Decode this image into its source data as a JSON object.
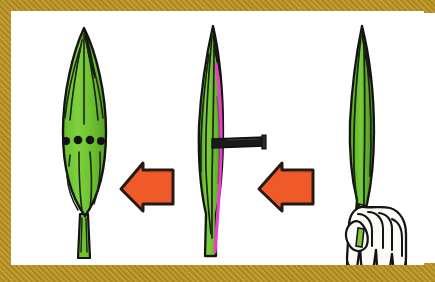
{
  "figure": {
    "title": "Folded leaf pierced with a pin, then unfolded to reveal a row of holes",
    "background_color": "#ffffff",
    "frame": {
      "color": "#b8911f",
      "style": "gold textured border",
      "thickness_px": {
        "top": 11,
        "bottom": 17,
        "left": 11,
        "right": 11
      }
    },
    "reading_direction": "right to left"
  },
  "palette": {
    "leaf_green_light": "#72c832",
    "leaf_green_mid": "#5aa82a",
    "leaf_green_dark": "#3f7d1e",
    "leaf_tip_dark": "#1d2a14",
    "outline": "#141414",
    "fold_magenta": "#e83fc8",
    "pin_black": "#1a1a1a",
    "arrow_orange": "#f05a28",
    "arrow_outline": "#241a14",
    "skin": "#fdfbf7",
    "frame_gold": "#b8911f",
    "paper_white": "#ffffff"
  },
  "panels": [
    {
      "id": "panel-open",
      "order": 3,
      "name": "unfolded-leaf-with-holes",
      "label": "Unfolded leaf showing four pin holes",
      "leaf_state": "flat / unfolded",
      "hole_count": 4,
      "hole_color": "#141414",
      "notes": "Four black dots in a horizontal row across the middle of the blade; short vein slits below"
    },
    {
      "id": "panel-pinned",
      "order": 2,
      "name": "folded-leaf-with-pin",
      "label": "Folded leaf pierced by a pin",
      "leaf_state": "folded lengthwise",
      "fold_edge_color": "#e83fc8",
      "pin": {
        "name": "pin",
        "color": "#1a1a1a",
        "orientation": "horizontal",
        "direction": "pushed through from the right"
      }
    },
    {
      "id": "panel-hand",
      "order": 1,
      "name": "hand-holding-folded-leaf",
      "label": "Hand holding the folded leaf upright",
      "leaf_state": "folded lengthwise",
      "hand": {
        "name": "hand",
        "grip": "stem held between thumb and fingers",
        "fill": "#fdfbf7"
      }
    }
  ],
  "arrows": [
    {
      "id": "arrow-right",
      "name": "arrow-right-to-middle",
      "direction": "left",
      "color": "#f05a28",
      "from": "panel-hand",
      "to": "panel-pinned"
    },
    {
      "id": "arrow-left",
      "name": "arrow-middle-to-left",
      "direction": "left",
      "color": "#f05a28",
      "from": "panel-pinned",
      "to": "panel-open"
    }
  ]
}
